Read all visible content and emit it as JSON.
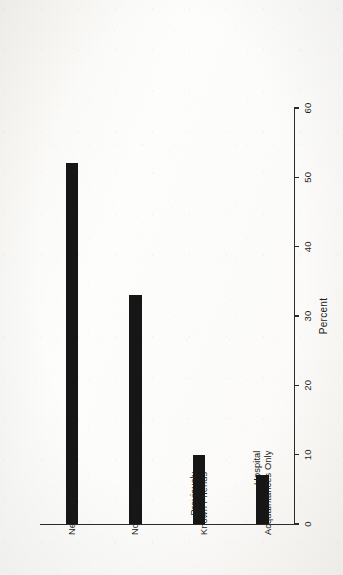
{
  "chart_data": {
    "type": "bar",
    "orientation": "vertical-rotated-90",
    "title": "",
    "subtitle": "",
    "categories": [
      "New Friends",
      "No Friends",
      "Previously\nKnown Friends",
      "Hospital\nAcquaintances Only"
    ],
    "values": [
      52,
      33,
      10,
      7
    ],
    "series": [
      {
        "name": "Percent",
        "values": [
          52,
          33,
          10,
          7
        ]
      }
    ],
    "xlabel": "",
    "ylabel": "Percent",
    "ylim": [
      0,
      60
    ],
    "tick_values": [
      0,
      10,
      20,
      30,
      40,
      50,
      60
    ],
    "tick_labels": [
      "0",
      "10",
      "20",
      "30",
      "40",
      "50",
      "60"
    ],
    "grid": false,
    "legend": false,
    "legend_position": "none",
    "bar_color": "#161616",
    "axis_color": "#2b2b2b",
    "background_color": "#fdfdfc",
    "annotations": []
  },
  "axis": {
    "value_axis_title": "Percent",
    "ticks": [
      {
        "label": "0",
        "value": 0
      },
      {
        "label": "10",
        "value": 10
      },
      {
        "label": "20",
        "value": 20
      },
      {
        "label": "30",
        "value": 30
      },
      {
        "label": "40",
        "value": 40
      },
      {
        "label": "50",
        "value": 50
      },
      {
        "label": "60",
        "value": 60
      }
    ]
  },
  "bars": [
    {
      "label": "New Friends",
      "value": 52
    },
    {
      "label": "No Friends",
      "value": 33
    },
    {
      "label": "Previously\nKnown Friends",
      "value": 10
    },
    {
      "label": "Hospital\nAcquaintances Only",
      "value": 7
    }
  ]
}
